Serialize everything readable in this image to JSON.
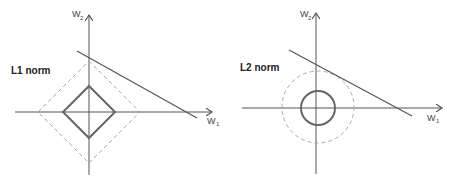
{
  "panels": [
    {
      "title": "L1 norm",
      "x_axis_label": "W",
      "x_axis_sub": "1",
      "y_axis_label": "W",
      "y_axis_sub": "2",
      "shape": "diamond",
      "solid_constraint_radius": 26,
      "dashed_constraint_radius": 51
    },
    {
      "title": "L2 norm",
      "x_axis_label": "W",
      "x_axis_sub": "1",
      "y_axis_label": "W",
      "y_axis_sub": "2",
      "shape": "circle",
      "solid_constraint_radius": 17,
      "dashed_constraint_radius": 36
    }
  ],
  "colors": {
    "axis": "#555555",
    "solid_shape": "#666666",
    "dashed_shape": "#aaaaaa",
    "line": "#555555"
  }
}
